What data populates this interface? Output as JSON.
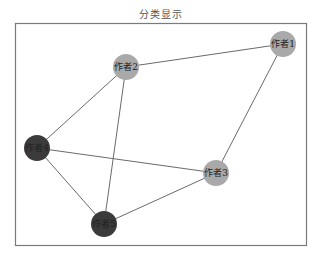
{
  "title": "分类显示",
  "colors": {
    "category_a": "#a9a9a9",
    "category_b": "#3b3b3b",
    "edge": "#6a6a6a"
  },
  "nodes": [
    {
      "id": "1",
      "label": "作者1",
      "category": "category_a"
    },
    {
      "id": "2",
      "label": "作者2",
      "category": "category_a"
    },
    {
      "id": "3",
      "label": "作者3",
      "category": "category_a"
    },
    {
      "id": "4",
      "label": "作者4",
      "category": "category_b"
    },
    {
      "id": "5",
      "label": "作者5",
      "category": "category_b"
    }
  ],
  "edges": [
    {
      "source": "2",
      "target": "1"
    },
    {
      "source": "2",
      "target": "4"
    },
    {
      "source": "2",
      "target": "5"
    },
    {
      "source": "1",
      "target": "3"
    },
    {
      "source": "4",
      "target": "3"
    },
    {
      "source": "4",
      "target": "5"
    },
    {
      "source": "3",
      "target": "5"
    }
  ]
}
